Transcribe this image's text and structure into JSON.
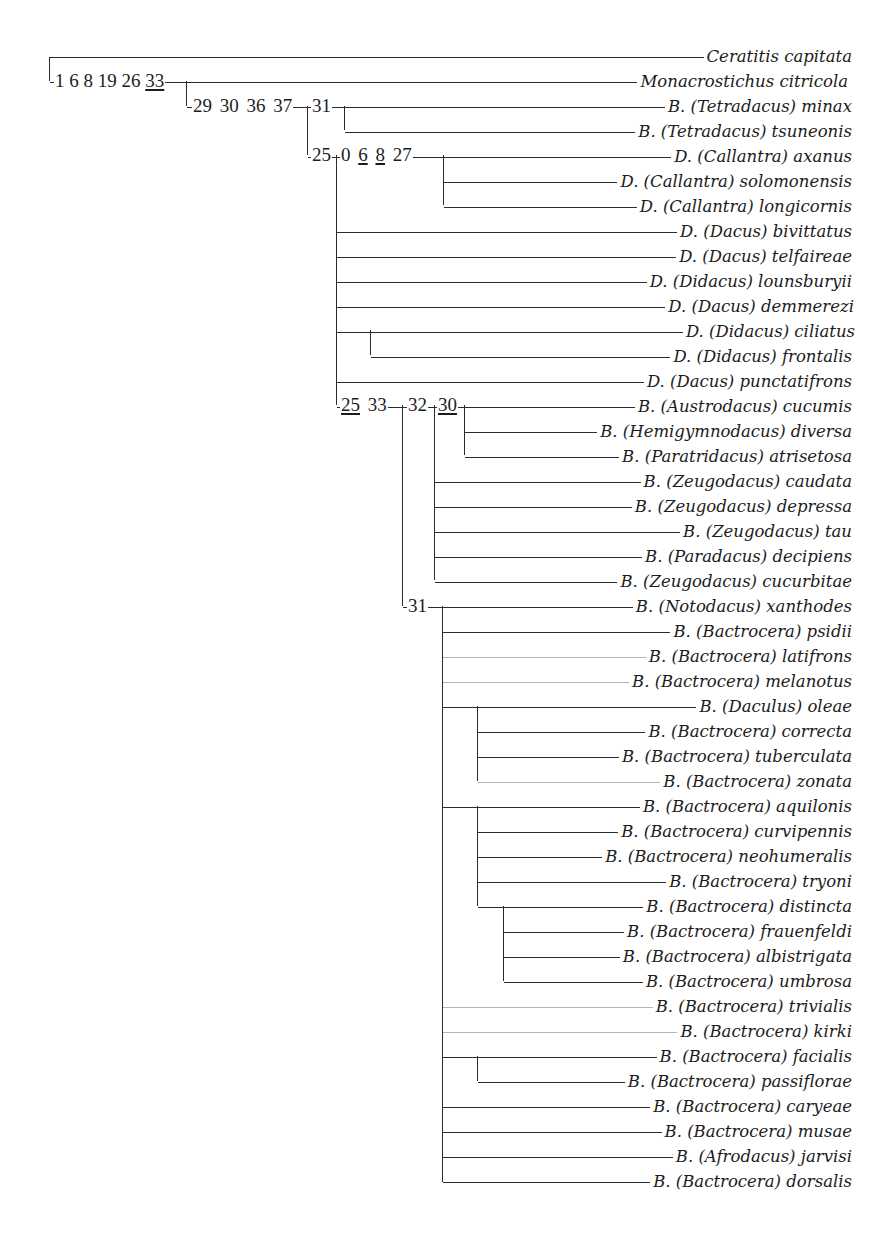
{
  "figure": {
    "type": "cladogram",
    "taxa": [
      "Ceratitis capitata",
      "Monacrostichus citricola",
      "B. (Tetradacus) minax",
      "B. (Tetradacus) tsuneonis",
      "D. (Callantra) axanus",
      "D. (Callantra) solomonensis",
      "D. (Callantra) longicornis",
      "D. (Dacus) bivittatus",
      "D. (Dacus) telfaireae",
      "D. (Didacus) lounsburyii",
      "D. (Dacus) demmerezi",
      "D. (Didacus) ciliatus",
      "D. (Didacus) frontalis",
      "D. (Dacus) punctatifrons",
      "B. (Austrodacus) cucumis",
      "B. (Hemigymnodacus) diversa",
      "B. (Paratridacus) atrisetosa",
      "B. (Zeugodacus) caudata",
      "B. (Zeugodacus) depressa",
      "B. (Zeugodacus) tau",
      "B. (Paradacus) decipiens",
      "B. (Zeugodacus) cucurbitae",
      "B. (Notodacus) xanthodes",
      "B. (Bactrocera) psidii",
      "B. (Bactrocera) latifrons",
      "B. (Bactrocera) melanotus",
      "B. (Daculus) oleae",
      "B. (Bactrocera) correcta",
      "B. (Bactrocera) tuberculata",
      "B. (Bactrocera) zonata",
      "B. (Bactrocera) aquilonis",
      "B. (Bactrocera) curvipennis",
      "B. (Bactrocera) neohumeralis",
      "B. (Bactrocera) tryoni",
      "B. (Bactrocera) distincta",
      "B. (Bactrocera) frauenfeldi",
      "B. (Bactrocera) albistrigata",
      "B. (Bactrocera) umbrosa",
      "B. (Bactrocera) trivialis",
      "B. (Bactrocera) kirki",
      "B. (Bactrocera) facialis",
      "B. (Bactrocera) passiflorae",
      "B. (Bactrocera) caryeae",
      "B. (Bactrocera) musae",
      "B. (Afrodacus) jarvisi",
      "B. (Bactrocera) dorsalis"
    ],
    "character_labels": {
      "node_monacrostichus": [
        {
          "text": "1 6 8 19 26 ",
          "underline": false
        },
        {
          "text": "33",
          "underline": true
        }
      ],
      "node_bactrocera_dacus": [
        {
          "text": "29 30 36 37",
          "underline": false
        }
      ],
      "node_tetradacus": [
        {
          "text": "31",
          "underline": false
        }
      ],
      "node_dacus_group": [
        {
          "text": "25",
          "underline": false
        }
      ],
      "node_callantra": [
        {
          "text": "0 ",
          "underline": false
        },
        {
          "text": "6",
          "underline": true
        },
        {
          "text": " ",
          "underline": false
        },
        {
          "text": "8",
          "underline": true
        },
        {
          "text": " 27",
          "underline": false
        }
      ],
      "node_bactrocera_group": [
        {
          "text": "25",
          "underline": true
        },
        {
          "text": " 33",
          "underline": false
        }
      ],
      "node_zeugodacus_group": [
        {
          "text": "32",
          "underline": false
        }
      ],
      "node_austrodacus_group": [
        {
          "text": "30",
          "underline": true
        }
      ],
      "node_bactrocera_s_str": [
        {
          "text": "31",
          "underline": false
        }
      ]
    },
    "tree_newick": "(Ceratitis capitata,(Monacrostichus citricola,((B. minax,B. tsuneonis),((D. axanus,D. solomonensis,D. longicornis),D. bivittatus,D. telfaireae,D. lounsburyii,D. demmerezi,(D. ciliatus,D. frontalis),D. punctatifrons,(((B. cucumis,B. diversa,B. atrisetosa),B. caudata,B. depressa,B. tau,B. decipiens,B. cucurbitae),(B. xanthodes,B. psidii,B. latifrons,B. melanotus,(B. oleae,B. correcta,B. tuberculata,B. zonata),(B. aquilonis,B. curvipennis,B. neohumeralis,B. tryoni,(B. distincta,B. frauenfeldi,B. albistrigata,B. umbrosa)),B. trivialis,B. kirki,(B. facialis,B. passiflorae),B. caryeae,B. musae,B. jarvisi,B. dorsalis)))))));"
  }
}
